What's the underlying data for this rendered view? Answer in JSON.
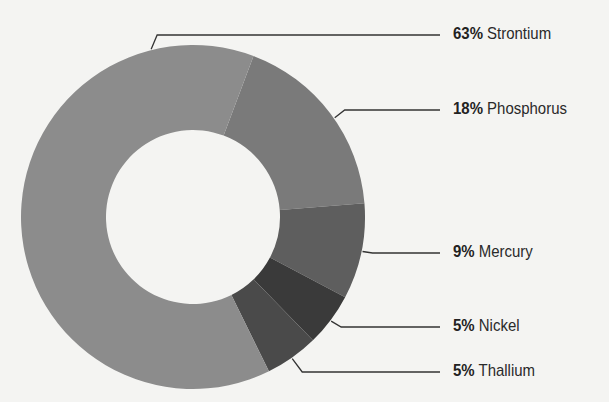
{
  "chart_data": {
    "type": "pie",
    "variant": "donut",
    "title": "",
    "slices": [
      {
        "label": "Strontium",
        "value": 63,
        "display": "63%",
        "color": "#8c8c8c"
      },
      {
        "label": "Phosphorus",
        "value": 18,
        "display": "18%",
        "color": "#7a7a7a"
      },
      {
        "label": "Mercury",
        "value": 9,
        "display": "9%",
        "color": "#5e5e5e"
      },
      {
        "label": "Nickel",
        "value": 5,
        "display": "5%",
        "color": "#3a3a3a"
      },
      {
        "label": "Thallium",
        "value": 5,
        "display": "5%",
        "color": "#4a4a4a"
      }
    ],
    "legend_position": "right, leader lines"
  },
  "labels": [
    {
      "pct": "63%",
      "name": "Strontium",
      "y": 35
    },
    {
      "pct": "18%",
      "name": "Phosphorus",
      "y": 110
    },
    {
      "pct": "9%",
      "name": "Mercury",
      "y": 253
    },
    {
      "pct": "5%",
      "name": "Nickel",
      "y": 327
    },
    {
      "pct": "5%",
      "name": "Thallium",
      "y": 372
    }
  ]
}
